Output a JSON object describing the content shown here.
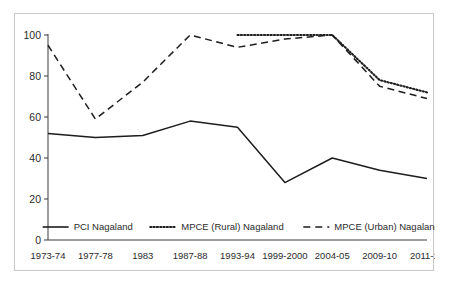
{
  "chart_data": {
    "type": "line",
    "title": "",
    "subtitle": "",
    "xlabel": "",
    "ylabel": "",
    "ylim": [
      0,
      100
    ],
    "yticks": [
      0,
      20,
      40,
      60,
      80,
      100
    ],
    "grid": false,
    "legend_position": "inside-bottom-center",
    "categories": [
      "1973-74",
      "1977-78",
      "1983",
      "1987-88",
      "1993-94",
      "1999-2000",
      "2004-05",
      "2009-10",
      "2011-12"
    ],
    "series": [
      {
        "name": "PCI Nagaland",
        "style": "solid",
        "color": "#1d1d1d",
        "values": [
          52,
          50,
          51,
          58,
          55,
          28,
          40,
          34,
          30
        ]
      },
      {
        "name": "MPCE (Rural) Nagaland",
        "style": "dotted",
        "color": "#1d1d1d",
        "values": [
          null,
          null,
          null,
          null,
          100,
          100,
          100,
          78,
          72
        ]
      },
      {
        "name": "MPCE (Urban) Nagaland",
        "style": "dashed",
        "color": "#1d1d1d",
        "values": [
          95,
          59,
          77,
          100,
          94,
          98,
          100,
          75,
          69
        ]
      }
    ]
  },
  "legend": {
    "items": [
      {
        "label": "PCI Nagaland",
        "style": "solid"
      },
      {
        "label": "MPCE (Rural) Nagaland",
        "style": "dotted"
      },
      {
        "label": "MPCE (Urban) Nagaland",
        "style": "dashed"
      }
    ]
  },
  "axis": {
    "y_tick_labels": [
      "100",
      "80",
      "60",
      "40",
      "20",
      "0"
    ],
    "x_tick_labels": [
      "1973-74",
      "1977-78",
      "1983",
      "1987-88",
      "1993-94",
      "1999-2000",
      "2004-05",
      "2009-10",
      "2011-12"
    ]
  }
}
